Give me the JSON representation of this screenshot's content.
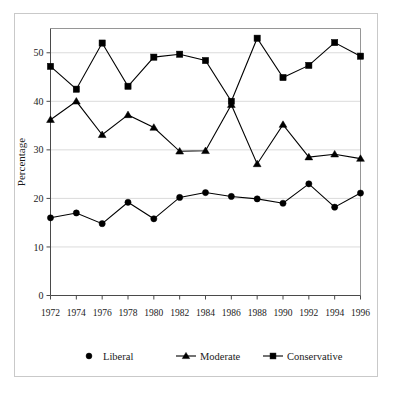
{
  "chart_data": {
    "type": "line",
    "title": "",
    "subtitle": "",
    "xlabel": "",
    "ylabel": "Percentage",
    "x": [
      1972,
      1974,
      1976,
      1978,
      1980,
      1982,
      1984,
      1986,
      1988,
      1990,
      1992,
      1994,
      1996
    ],
    "categories": [
      "1972",
      "1974",
      "1976",
      "1978",
      "1980",
      "1982",
      "1984",
      "1986",
      "1988",
      "1990",
      "1992",
      "1994",
      "1996"
    ],
    "series": [
      {
        "name": "Liberal",
        "marker": "circle",
        "color": "#000000",
        "values": [
          16.0,
          17.0,
          14.8,
          19.2,
          15.8,
          20.2,
          21.2,
          20.4,
          19.9,
          19.0,
          23.0,
          18.2,
          21.1
        ]
      },
      {
        "name": "Moderate",
        "marker": "triangle",
        "color": "#000000",
        "values": [
          36.2,
          40.0,
          33.1,
          37.2,
          34.6,
          29.7,
          29.8,
          39.3,
          27.1,
          35.2,
          28.5,
          29.1,
          28.2
        ]
      },
      {
        "name": "Conservative",
        "marker": "square",
        "color": "#000000",
        "values": [
          47.2,
          42.5,
          52.0,
          43.1,
          49.1,
          49.7,
          48.4,
          40.0,
          53.0,
          44.9,
          47.4,
          52.1,
          49.3
        ]
      }
    ],
    "ylim": [
      0,
      55
    ],
    "yticks": [
      0,
      10,
      20,
      30,
      40,
      50
    ],
    "ytick_labels": [
      "0",
      "10",
      "20",
      "30",
      "40",
      "50"
    ],
    "xlim": [
      1971,
      1997
    ],
    "grid": true,
    "grid_axis": "y",
    "legend_position": "bottom",
    "legend_entries": [
      "Liberal",
      "Moderate",
      "Conservative"
    ]
  }
}
